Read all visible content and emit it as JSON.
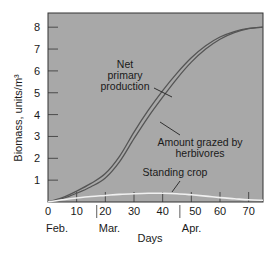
{
  "chart_data": {
    "type": "line",
    "title": "",
    "xlabel": "Days",
    "ylabel": "Biomass, units/m³",
    "xlim": [
      0,
      75
    ],
    "ylim": [
      0,
      8.6
    ],
    "x_ticks": [
      0,
      10,
      20,
      30,
      40,
      50,
      60,
      70
    ],
    "y_ticks": [
      1,
      2,
      3,
      4,
      5,
      6,
      7,
      8
    ],
    "month_labels": [
      {
        "label": "Feb.",
        "day": 0
      },
      {
        "label": "Mar.",
        "day": 17
      },
      {
        "label": "Apr.",
        "day": 46
      }
    ],
    "grid": false,
    "background": "#a8a8a8",
    "x": [
      0,
      5,
      10,
      15,
      20,
      25,
      30,
      35,
      40,
      45,
      50,
      55,
      60,
      65,
      70,
      75
    ],
    "series": [
      {
        "name": "Net primary production",
        "color": "#555555",
        "values": [
          0,
          0.2,
          0.5,
          0.85,
          1.3,
          2.1,
          3.2,
          4.2,
          5.1,
          5.9,
          6.6,
          7.15,
          7.55,
          7.8,
          7.95,
          8.0
        ]
      },
      {
        "name": "Amount grazed by herbivores",
        "color": "#555555",
        "values": [
          0,
          0.15,
          0.4,
          0.7,
          1.1,
          1.85,
          2.9,
          3.9,
          4.8,
          5.65,
          6.4,
          7.0,
          7.45,
          7.75,
          7.93,
          8.0
        ]
      },
      {
        "name": "Standing crop",
        "color": "#f0f0f0",
        "values": [
          0,
          0.1,
          0.18,
          0.25,
          0.3,
          0.35,
          0.38,
          0.4,
          0.4,
          0.38,
          0.33,
          0.27,
          0.2,
          0.15,
          0.1,
          0.08
        ]
      }
    ],
    "annotations": [
      {
        "text": [
          "Net",
          "primary",
          "production"
        ],
        "target": "Net primary production"
      },
      {
        "text": [
          "Amount grazed by",
          "herbivores"
        ],
        "target": "Amount grazed by herbivores"
      },
      {
        "text": [
          "Standing crop"
        ],
        "target": "Standing crop"
      }
    ]
  }
}
